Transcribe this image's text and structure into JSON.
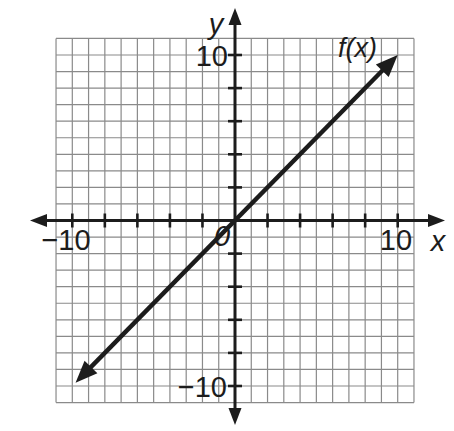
{
  "page": {
    "background": "#ffffff"
  },
  "chart_data": {
    "type": "line",
    "title": "",
    "xlabel": "x",
    "ylabel": "y",
    "xlim": [
      -11,
      11
    ],
    "ylim": [
      -11,
      11
    ],
    "grid": true,
    "grid_step": 1,
    "tick_step": 2,
    "legend": "none",
    "origin_label": "0",
    "x_tick_labels": [
      {
        "value": -10,
        "text": "−10"
      },
      {
        "value": 10,
        "text": "10"
      }
    ],
    "y_tick_labels": [
      {
        "value": 10,
        "text": "10"
      },
      {
        "value": -10,
        "text": "−10"
      }
    ],
    "series": [
      {
        "name": "f(x)",
        "label": "f(x)",
        "equation": "f(x) = x",
        "slope": 1,
        "y_intercept": 0,
        "x": [
          -9.8,
          10
        ],
        "y": [
          -9.8,
          10
        ],
        "arrows_both_ends": true,
        "color": "#1c1c1c"
      }
    ],
    "colors": {
      "grid": "#8a8a8a",
      "axis": "#1c1c1c",
      "text": "#1c1c1c"
    }
  }
}
